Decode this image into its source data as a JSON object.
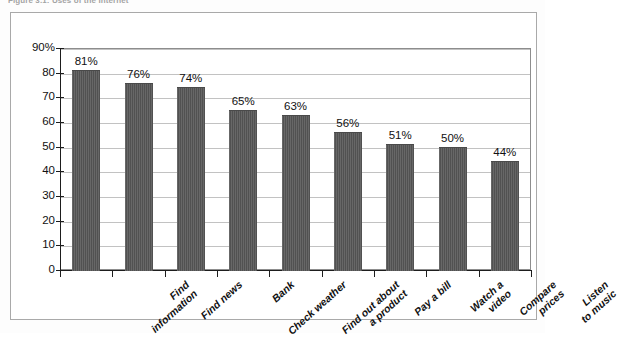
{
  "figure": {
    "caption": "Figure 3.1: Uses of the Internet"
  },
  "chart_data": {
    "type": "bar",
    "title": "",
    "xlabel": "",
    "ylabel": "",
    "ylim": [
      0,
      90
    ],
    "ytick_values": [
      0,
      10,
      20,
      30,
      40,
      50,
      60,
      70,
      80,
      90
    ],
    "ytick_labels": [
      "0",
      "10",
      "20",
      "30",
      "40",
      "50",
      "60",
      "70",
      "80",
      "90%"
    ],
    "grid": true,
    "legend": "none",
    "orientation": "vertical",
    "bar_color": "#565656",
    "categories": [
      "Find\ninformation",
      "Find news",
      "Bank",
      "Check weather",
      "Find out about\na product",
      "Pay a bill",
      "Watch a\nvideo",
      "Compare\nprices",
      "Listen\nto music"
    ],
    "values": [
      81,
      76,
      74,
      65,
      63,
      56,
      51,
      50,
      44
    ],
    "data_labels": [
      "81%",
      "76%",
      "74%",
      "65%",
      "63%",
      "56%",
      "51%",
      "50%",
      "44%"
    ]
  }
}
